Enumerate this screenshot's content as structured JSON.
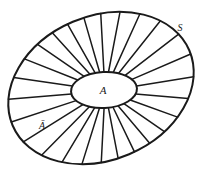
{
  "figure": {
    "stroke_color": "#1a1a1a",
    "fill_color": "#ffffff",
    "background": "#ffffff"
  },
  "outer_ellipse": {
    "name": "outer-boundary-ellipse",
    "cx": 101,
    "cy": 88,
    "rx": 96,
    "ry": 72,
    "rotation_deg": -23
  },
  "inner_ellipse": {
    "name": "inner-region-ellipse",
    "cx": 104,
    "cy": 90,
    "rx": 33,
    "ry": 18,
    "rotation_deg": -3
  },
  "spokes": {
    "name": "radial-spokes",
    "count": 26
  },
  "labels": {
    "inner_region": "A",
    "annulus_region": "Ā",
    "outer_boundary": "S"
  },
  "label_positions": {
    "inner_region": {
      "x": 103,
      "y": 94
    },
    "annulus_region": {
      "x": 42,
      "y": 129
    },
    "outer_boundary": {
      "x": 180,
      "y": 31
    }
  }
}
